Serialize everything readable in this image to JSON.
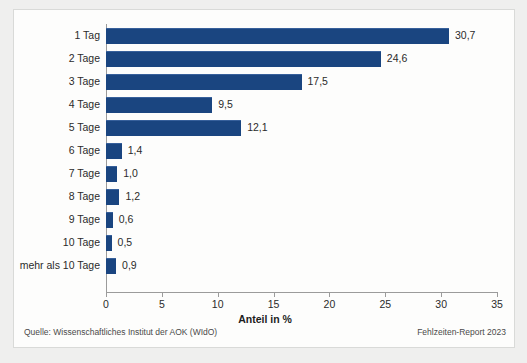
{
  "chart_data": {
    "type": "bar",
    "orientation": "horizontal",
    "title": "",
    "xlabel": "Anteil in %",
    "ylabel": "",
    "xlim": [
      0,
      35
    ],
    "xticks": [
      0,
      5,
      10,
      15,
      20,
      25,
      30,
      35
    ],
    "xtick_labels": [
      "0",
      "5",
      "10",
      "15",
      "20",
      "25",
      "30",
      "35"
    ],
    "grid": false,
    "legend": null,
    "bar_color": "#1a4580",
    "categories": [
      "1 Tag",
      "2 Tage",
      "3 Tage",
      "4 Tage",
      "5 Tage",
      "6 Tage",
      "7 Tage",
      "8 Tage",
      "9 Tage",
      "10 Tage",
      "mehr als 10 Tage"
    ],
    "values": [
      30.7,
      24.6,
      17.5,
      9.5,
      12.1,
      1.4,
      1.0,
      1.2,
      0.6,
      0.5,
      0.9
    ],
    "value_labels": [
      "30,7",
      "24,6",
      "17,5",
      "9,5",
      "12,1",
      "1,4",
      "1,0",
      "1,2",
      "0,6",
      "0,5",
      "0,9"
    ]
  },
  "footer": {
    "source": "Quelle: Wissenschaftliches Institut der AOK (WIdO)",
    "report": "Fehlzeiten-Report 2023"
  }
}
